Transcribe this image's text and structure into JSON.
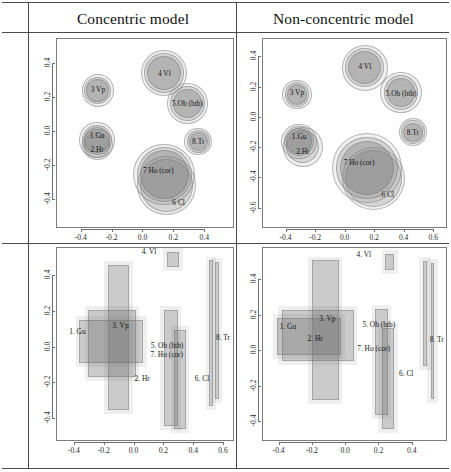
{
  "figure": {
    "columns": [
      {
        "title": "Concentric model"
      },
      {
        "title": "Non-concentric model"
      }
    ],
    "rows": [
      {
        "label": "Circle model"
      },
      {
        "label": "Rectagle model"
      }
    ]
  },
  "legend_items": [
    "1. Gu",
    "2. Hr",
    "3. Vp",
    "4. Vl",
    "5. Ob (htb)",
    "6. Cl",
    "7. Ho (cor)",
    "8. Tr"
  ],
  "chart_data": [
    {
      "id": "circle-concentric",
      "type": "scatter",
      "title": "Concentric model",
      "row": "Circle model",
      "xlabel": "",
      "ylabel": "",
      "xlim": [
        -0.56,
        0.58
      ],
      "ylim": [
        -0.56,
        0.55
      ],
      "xticks": [
        -0.4,
        -0.2,
        0.0,
        0.2,
        0.4
      ],
      "xticklabels": [
        "-0.4",
        "-0.2",
        "0.0",
        "0.2",
        "0.4"
      ],
      "yticks": [
        0.4,
        0.2,
        0.0,
        -0.2,
        -0.4
      ],
      "yticklabels": [
        "0.4",
        "0.2",
        "0.0",
        "-0.2",
        "-0.4"
      ],
      "grid": false,
      "legend": "none",
      "points": [
        {
          "label": "3. Vp",
          "label_text": "3 Vp",
          "x": -0.295,
          "y": 0.245,
          "r": 0.105,
          "rings": [
            0.105,
            0.088,
            0.074
          ]
        },
        {
          "label": "1. Gu",
          "label_text": "1.Gu",
          "x": -0.3,
          "y": -0.045,
          "r": 0.115,
          "rings": [
            0.115,
            0.098,
            0.085
          ]
        },
        {
          "label": "2. Hr",
          "label_text": "2.Hr",
          "x": -0.3,
          "y": -0.075,
          "r": 0.1,
          "rings": [
            0.1,
            0.086
          ]
        },
        {
          "label": "4. Vl",
          "label_text": "4 Vl",
          "x": 0.135,
          "y": 0.35,
          "r": 0.15,
          "rings": [
            0.15,
            0.13,
            0.11
          ]
        },
        {
          "label": "5. Ob (htb)",
          "label_text": "5.Ob (htb)",
          "x": 0.285,
          "y": 0.17,
          "r": 0.135,
          "rings": [
            0.135,
            0.115,
            0.095
          ]
        },
        {
          "label": "8. Tr",
          "label_text": "8.Tr",
          "x": 0.355,
          "y": -0.055,
          "r": 0.09,
          "rings": [
            0.09,
            0.076,
            0.062
          ]
        },
        {
          "label": "7. Ho (cor)",
          "label_text": "7 Ho (cor)",
          "x": 0.135,
          "y": -0.25,
          "r": 0.2,
          "rings": [
            0.2,
            0.178,
            0.158
          ]
        },
        {
          "label": "6. Cl",
          "label_text": "6 Cl",
          "x": 0.15,
          "y": -0.315,
          "r": 0.19,
          "rings": [
            0.19,
            0.17
          ]
        }
      ]
    },
    {
      "id": "circle-nonconcentric",
      "type": "scatter",
      "title": "Non-concentric model",
      "row": "Circle model",
      "xlabel": "",
      "ylabel": "",
      "xlim": [
        -0.56,
        0.68
      ],
      "ylim": [
        -0.72,
        0.52
      ],
      "xticks": [
        -0.4,
        -0.2,
        0.0,
        0.2,
        0.4,
        0.6
      ],
      "xticklabels": [
        "-0.4",
        "-0.2",
        "0.0",
        "0.2",
        "0.4",
        "0.6"
      ],
      "yticks": [
        0.4,
        0.2,
        0.0,
        -0.2,
        -0.4,
        -0.6
      ],
      "yticklabels": [
        "0.4",
        "0.2",
        "0.0",
        "-0.2",
        "-0.4",
        "-0.6"
      ],
      "grid": false,
      "legend": "none",
      "points": [
        {
          "label": "3. Vp",
          "label_text": "3 Vp",
          "x": -0.33,
          "y": 0.155,
          "r": 0.1,
          "rings": [
            0.1,
            0.084,
            0.07
          ]
        },
        {
          "label": "1. Gu",
          "label_text": "1.Gu",
          "x": -0.315,
          "y": -0.155,
          "r": 0.12,
          "rings": [
            0.12,
            0.102,
            0.088
          ]
        },
        {
          "label": "2. Hr",
          "label_text": "2.Hr",
          "x": -0.29,
          "y": -0.19,
          "r": 0.135,
          "rings": [
            0.135,
            0.112
          ]
        },
        {
          "label": "4. Vl",
          "label_text": "4 Vl",
          "x": 0.13,
          "y": 0.33,
          "r": 0.155,
          "rings": [
            0.155,
            0.132,
            0.112
          ]
        },
        {
          "label": "5. Ob (htb)",
          "label_text": "5.Ob (htb)",
          "x": 0.375,
          "y": 0.165,
          "r": 0.14,
          "rings": [
            0.14,
            0.118,
            0.098
          ]
        },
        {
          "label": "8. Tr",
          "label_text": "8.Tr",
          "x": 0.455,
          "y": -0.095,
          "r": 0.095,
          "rings": [
            0.095,
            0.08,
            0.066
          ]
        },
        {
          "label": "7. Ho (cor)",
          "label_text": "7 Ho (cor)",
          "x": 0.145,
          "y": -0.33,
          "r": 0.235,
          "rings": [
            0.235,
            0.208,
            0.184
          ]
        },
        {
          "label": "6. Cl",
          "label_text": "6 Cl",
          "x": 0.19,
          "y": -0.4,
          "r": 0.215,
          "rings": [
            0.215,
            0.192
          ]
        }
      ]
    },
    {
      "id": "rect-concentric",
      "type": "bar",
      "title": "Concentric model",
      "row": "Rectagle model",
      "xlabel": "",
      "ylabel": "",
      "xlim": [
        -0.52,
        0.66
      ],
      "ylim": [
        -0.52,
        0.56
      ],
      "xticks": [
        -0.4,
        -0.2,
        0.0,
        0.2,
        0.4,
        0.6
      ],
      "xticklabels": [
        "-0.4",
        "-0.2",
        "0.0",
        "0.2",
        "0.4",
        "0.6"
      ],
      "yticks": [
        0.4,
        0.2,
        0.0,
        -0.2,
        -0.4
      ],
      "yticklabels": [
        "0.4",
        "0.2",
        "0.0",
        "-0.2",
        "-0.4"
      ],
      "grid": false,
      "legend": "none",
      "boxes": [
        {
          "label": "1. Gu",
          "x0": -0.37,
          "x1": 0.06,
          "y0": -0.085,
          "y1": 0.155
        },
        {
          "label": "2. Hr",
          "x0": -0.31,
          "x1": 0.01,
          "y0": -0.165,
          "y1": 0.21
        },
        {
          "label": "3. Vp",
          "x0": -0.18,
          "x1": -0.035,
          "y0": -0.35,
          "y1": 0.465
        },
        {
          "label": "4. Vl",
          "x0": 0.215,
          "x1": 0.3,
          "y0": 0.455,
          "y1": 0.54
        },
        {
          "label": "5. Ob (htb)",
          "x0": 0.5,
          "x1": 0.525,
          "y0": -0.33,
          "y1": 0.49
        },
        {
          "label": "6. Cl",
          "x0": 0.265,
          "x1": 0.345,
          "y0": -0.46,
          "y1": 0.1
        },
        {
          "label": "7. Ho (cor)",
          "x0": 0.195,
          "x1": 0.29,
          "y0": -0.44,
          "y1": 0.21
        },
        {
          "label": "8. Tr",
          "x0": 0.54,
          "x1": 0.565,
          "y0": -0.29,
          "y1": 0.48
        }
      ]
    },
    {
      "id": "rect-nonconcentric",
      "type": "bar",
      "title": "Non-concentric model",
      "row": "Rectagle model",
      "xlabel": "",
      "ylabel": "",
      "xlim": [
        -0.5,
        0.6
      ],
      "ylim": [
        -0.5,
        0.58
      ],
      "xticks": [
        -0.4,
        -0.2,
        0.0,
        0.2,
        0.4
      ],
      "xticklabels": [
        "-0.4",
        "-0.2",
        "0.0",
        "0.2",
        "0.4"
      ],
      "yticks": [
        0.4,
        0.2,
        0.0,
        -0.2,
        -0.4
      ],
      "yticklabels": [
        "0.4",
        "0.2",
        "0.0",
        "-0.2",
        "-0.4"
      ],
      "grid": false,
      "legend": "none",
      "boxes": [
        {
          "label": "1. Gu",
          "x0": -0.385,
          "x1": 0.045,
          "y0": -0.055,
          "y1": 0.23
        },
        {
          "label": "2. Hr",
          "x0": -0.415,
          "x1": -0.03,
          "y0": -0.02,
          "y1": 0.185
        },
        {
          "label": "3. Vp",
          "x0": -0.205,
          "x1": -0.045,
          "y0": -0.275,
          "y1": 0.51
        },
        {
          "label": "4. Vl",
          "x0": 0.235,
          "x1": 0.29,
          "y0": 0.455,
          "y1": 0.545
        },
        {
          "label": "5. Ob (htb)",
          "x0": 0.46,
          "x1": 0.485,
          "y0": -0.085,
          "y1": 0.505
        },
        {
          "label": "6. Cl",
          "x0": 0.215,
          "x1": 0.29,
          "y0": -0.44,
          "y1": 0.13
        },
        {
          "label": "7. Ho (cor)",
          "x0": 0.175,
          "x1": 0.25,
          "y0": -0.36,
          "y1": 0.235
        },
        {
          "label": "8. Tr",
          "x0": 0.51,
          "x1": 0.53,
          "y0": -0.27,
          "y1": 0.495
        }
      ]
    }
  ]
}
